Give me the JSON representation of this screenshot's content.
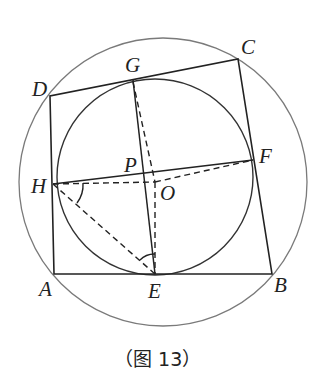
{
  "figure": {
    "caption": "（图 13）",
    "points": {
      "A": "A",
      "B": "B",
      "C": "C",
      "D": "D",
      "E": "E",
      "F": "F",
      "G": "G",
      "H": "H",
      "O": "O",
      "P": "P"
    },
    "colors": {
      "line": "#222222",
      "outer_circle": "#777777"
    }
  }
}
